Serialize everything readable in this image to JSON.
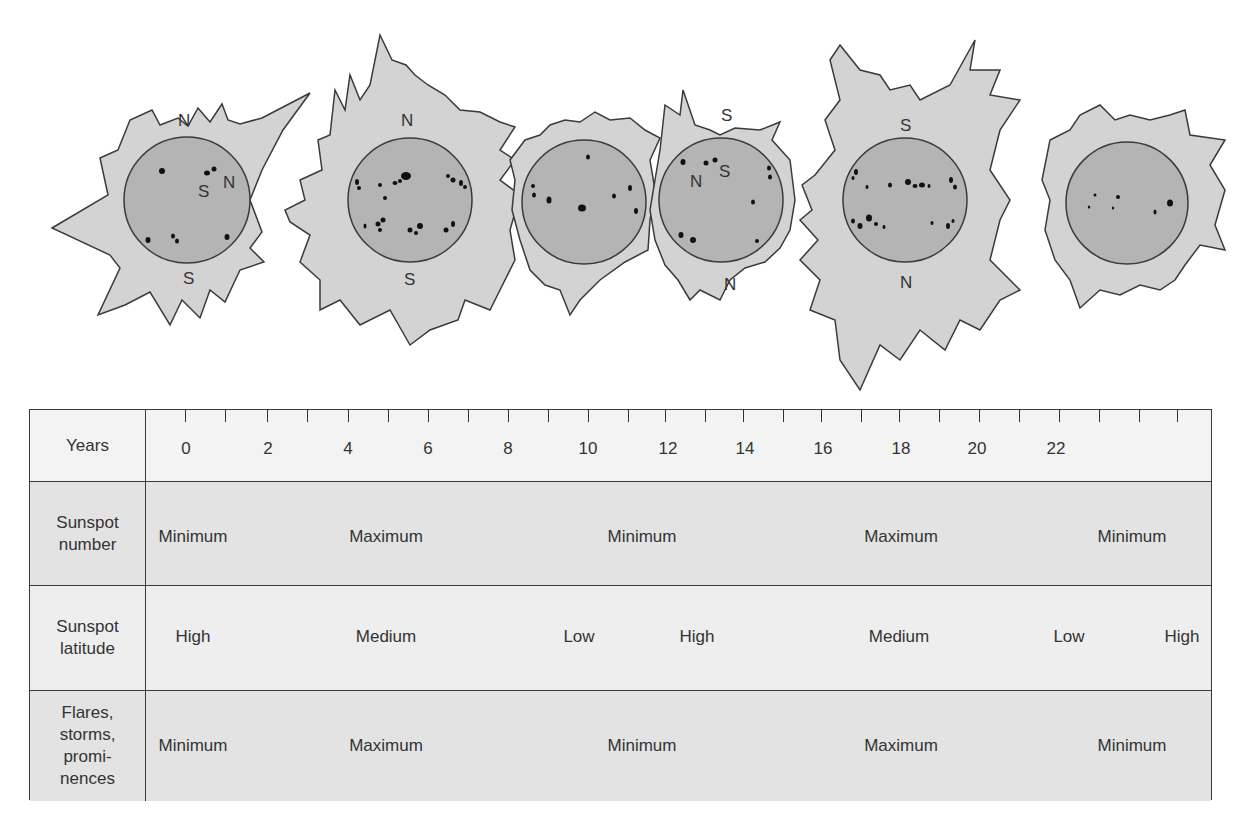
{
  "diagram": {
    "suns": [
      {
        "id": 1,
        "labels": {
          "top": "N",
          "bottom": "S",
          "inner_s": "S",
          "inner_n": "N"
        },
        "phase": "Minimum"
      },
      {
        "id": 2,
        "labels": {
          "top": "N",
          "bottom": "S"
        },
        "phase": "Maximum"
      },
      {
        "id": 3,
        "labels": {},
        "phase": "Minimum"
      },
      {
        "id": 4,
        "labels": {
          "top": "S",
          "bottom": "N",
          "inner_n": "N",
          "inner_s": "S"
        },
        "phase": "Minimum"
      },
      {
        "id": 5,
        "labels": {
          "top": "S",
          "bottom": "N"
        },
        "phase": "Maximum"
      },
      {
        "id": 6,
        "labels": {},
        "phase": "Minimum"
      }
    ],
    "colors": {
      "corona": "#d3d3d3",
      "disk": "#b4b4b4",
      "outline": "#3a3a3a",
      "sunspot": "#111111",
      "table_bg": "#f1f1f1",
      "table_shaded": "#e3e3e3"
    }
  },
  "table": {
    "years_label": "Years",
    "years": [
      "0",
      "2",
      "4",
      "6",
      "8",
      "10",
      "12",
      "14",
      "16",
      "18",
      "20",
      "22"
    ],
    "rows": [
      {
        "label_line1": "Sunspot",
        "label_line2": "number",
        "values": [
          "Minimum",
          "Maximum",
          "Minimum",
          "Maximum",
          "Minimum"
        ]
      },
      {
        "label_line1": "Sunspot",
        "label_line2": "latitude",
        "values": [
          "High",
          "Medium",
          "Low",
          "High",
          "Medium",
          "Low",
          "High"
        ]
      },
      {
        "label_line1": "Flares,",
        "label_line2": "storms,",
        "label_line3": "promi-",
        "label_line4": "nences",
        "values": [
          "Minimum",
          "Maximum",
          "Minimum",
          "Maximum",
          "Minimum"
        ]
      }
    ]
  }
}
